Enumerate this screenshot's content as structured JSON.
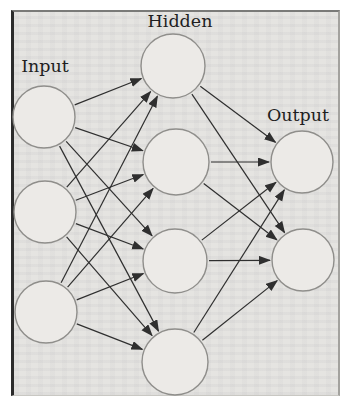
{
  "chart_data": {
    "type": "diagram",
    "layer_labels": [
      {
        "id": "input",
        "text": "Input",
        "x": 45,
        "y": 72
      },
      {
        "id": "hidden",
        "text": "Hidden",
        "x": 180,
        "y": 27
      },
      {
        "id": "output",
        "text": "Output",
        "x": 298,
        "y": 121
      }
    ],
    "nodes": [
      {
        "id": "i1",
        "layer": "input",
        "x": 44,
        "y": 117,
        "r": 31
      },
      {
        "id": "i2",
        "layer": "input",
        "x": 45,
        "y": 212,
        "r": 31
      },
      {
        "id": "i3",
        "layer": "input",
        "x": 46,
        "y": 312,
        "r": 31
      },
      {
        "id": "h1",
        "layer": "hidden",
        "x": 173,
        "y": 66,
        "r": 32
      },
      {
        "id": "h2",
        "layer": "hidden",
        "x": 176,
        "y": 162,
        "r": 33
      },
      {
        "id": "h3",
        "layer": "hidden",
        "x": 175,
        "y": 261,
        "r": 32
      },
      {
        "id": "h4",
        "layer": "hidden",
        "x": 175,
        "y": 362,
        "r": 33
      },
      {
        "id": "o1",
        "layer": "output",
        "x": 302,
        "y": 162,
        "r": 31
      },
      {
        "id": "o2",
        "layer": "output",
        "x": 303,
        "y": 260,
        "r": 31
      }
    ],
    "edges": [
      [
        "i1",
        "h1"
      ],
      [
        "i1",
        "h2"
      ],
      [
        "i1",
        "h3"
      ],
      [
        "i1",
        "h4"
      ],
      [
        "i2",
        "h1"
      ],
      [
        "i2",
        "h2"
      ],
      [
        "i2",
        "h3"
      ],
      [
        "i2",
        "h4"
      ],
      [
        "i3",
        "h1"
      ],
      [
        "i3",
        "h2"
      ],
      [
        "i3",
        "h3"
      ],
      [
        "i3",
        "h4"
      ],
      [
        "h1",
        "o1"
      ],
      [
        "h1",
        "o2"
      ],
      [
        "h2",
        "o1"
      ],
      [
        "h2",
        "o2"
      ],
      [
        "h3",
        "o1"
      ],
      [
        "h3",
        "o2"
      ],
      [
        "h4",
        "o1"
      ],
      [
        "h4",
        "o2"
      ]
    ],
    "colors": {
      "page_background": "#ffffff",
      "figure_background": "#e5e4e1",
      "node_fill": "#eceae7",
      "node_stroke": "#8f8e8b",
      "edge": "#2f2f2f",
      "label_text": "#1f1f1f",
      "frame_left": "#2b2b2b",
      "frame_top": "#7a7a78",
      "frame_right": "#a3a29e"
    }
  }
}
